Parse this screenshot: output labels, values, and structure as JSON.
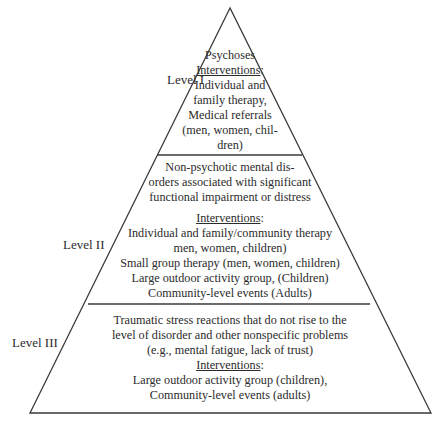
{
  "diagram": {
    "type": "pyramid",
    "levels": [
      {
        "label": "Level I",
        "condition_lines": [
          "Psychoses"
        ],
        "interventions_heading": "Interventions",
        "interventions_heading_suffix": ":",
        "intervention_lines": [
          "Individual and",
          "family therapy,",
          "Medical referrals",
          "(men, women, chil-",
          "dren)"
        ]
      },
      {
        "label": "Level II",
        "condition_lines": [
          "Non-psychotic mental dis-",
          "orders associated with significant",
          "functional impairment or distress"
        ],
        "interventions_heading": "Interventions",
        "interventions_heading_suffix": ":",
        "intervention_lines": [
          "Individual and family/community therapy",
          "men, women, children)",
          "Small group therapy (men, women, children)",
          "Large outdoor activity group,  (Children)",
          "Community-level events (Adults)"
        ]
      },
      {
        "label": "Level III",
        "condition_lines": [
          "Traumatic stress reactions that do not rise to the",
          "level of disorder and other nonspecific problems",
          "(e.g., mental fatigue, lack of trust)"
        ],
        "interventions_heading": "Interventions",
        "interventions_heading_suffix": ":",
        "intervention_lines": [
          "Large outdoor activity group (children),",
          "Community-level events (adults)"
        ]
      }
    ],
    "colors": {
      "line": "#3a3a3a",
      "text": "#2b2b2b",
      "background": "#ffffff"
    }
  }
}
